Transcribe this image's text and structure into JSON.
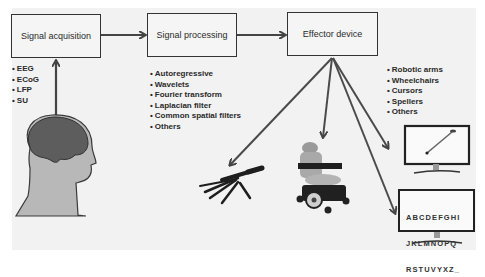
{
  "diagram": {
    "type": "flowchart",
    "stages": [
      {
        "id": "acquisition",
        "label": "Signal acquisition",
        "items": [
          "EEG",
          "ECoG",
          "LFP",
          "SU"
        ]
      },
      {
        "id": "processing",
        "label": "Signal processing",
        "items": [
          "Autoregressive",
          "Wavelets",
          "Fourier transform",
          "Laplacian filter",
          "Common spatial filters",
          "Others"
        ]
      },
      {
        "id": "effector",
        "label": "Effector device",
        "items": [
          "Robotic arms",
          "Wheelchairs",
          "Cursors",
          "Spellers",
          "Others"
        ]
      }
    ],
    "speller": {
      "rows": [
        "ABCDEFGHI",
        "JKLMNOPQ",
        "RSTUVYXZ_"
      ]
    },
    "illustrations": [
      "human-head-brain",
      "robotic-hand",
      "power-wheelchair",
      "cursor-monitor",
      "speller-monitor"
    ],
    "colors": {
      "panel": "#f2f2f2",
      "stroke": "#333333",
      "arrow": "#555555",
      "brain": "#5e5e5e",
      "head": "#b9b9b9"
    }
  }
}
